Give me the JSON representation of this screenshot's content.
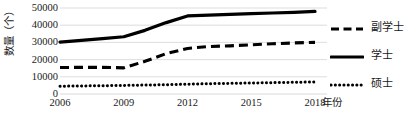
{
  "chart_data": {
    "type": "line",
    "title": "",
    "xlabel": "年份",
    "ylabel": "数量（个）",
    "x": [
      2006,
      2007,
      2008,
      2009,
      2010,
      2011,
      2012,
      2013,
      2014,
      2015,
      2016,
      2017,
      2018
    ],
    "xticks": [
      "2006",
      "2009",
      "2012",
      "2015",
      "2018"
    ],
    "xtick_values": [
      2006,
      2009,
      2012,
      2015,
      2018
    ],
    "xlim": [
      2006,
      2018
    ],
    "ylim": [
      0,
      50000
    ],
    "yticks": [
      "0",
      "10000",
      "20000",
      "30000",
      "40000",
      "50000"
    ],
    "ytick_values": [
      0,
      10000,
      20000,
      30000,
      40000,
      50000
    ],
    "grid": "horizontal",
    "grid_color": "#d9d9d9",
    "legend_position": "right",
    "series": [
      {
        "name": "副学士",
        "style": "dashed",
        "color": "#000000",
        "values": [
          15400,
          15500,
          15500,
          15200,
          19000,
          23500,
          26500,
          27600,
          28000,
          28600,
          29200,
          29700,
          30000
        ]
      },
      {
        "name": "学士",
        "style": "solid",
        "color": "#000000",
        "values": [
          30200,
          31200,
          32200,
          33300,
          37000,
          41500,
          45400,
          45900,
          46300,
          46700,
          47100,
          47500,
          48000
        ]
      },
      {
        "name": "硕士",
        "style": "dotted",
        "color": "#000000",
        "values": [
          4500,
          4700,
          4800,
          5000,
          5200,
          5400,
          5700,
          6000,
          6200,
          6400,
          6600,
          6800,
          7000
        ]
      }
    ]
  },
  "legend": {
    "entries": [
      {
        "label": "副学士",
        "style": "dashed"
      },
      {
        "label": "学士",
        "style": "solid"
      },
      {
        "label": "硕士",
        "style": "dotted"
      }
    ]
  }
}
